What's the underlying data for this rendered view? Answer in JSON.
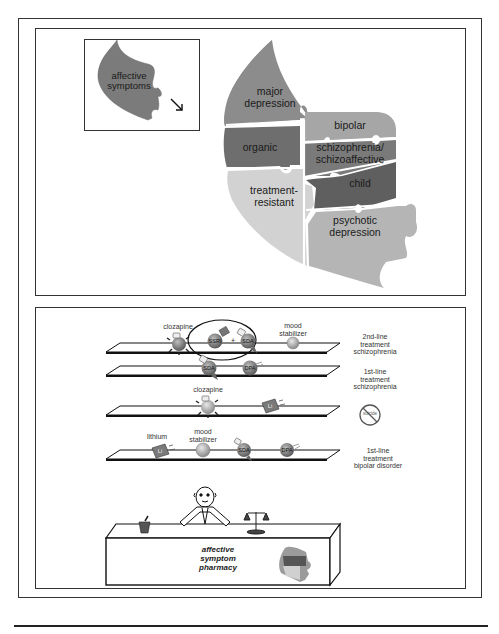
{
  "figure": {
    "top_panel": {
      "inset": {
        "piece_label_line1": "affective",
        "piece_label_line2": "symptoms",
        "arrow": "arrow-down-right"
      },
      "puzzle_pieces": [
        {
          "id": "major-depression",
          "line1": "major",
          "line2": "depression",
          "color": "#8c8c8c"
        },
        {
          "id": "bipolar",
          "line1": "bipolar",
          "line2": "",
          "color": "#a6a6a6"
        },
        {
          "id": "organic",
          "line1": "organic",
          "line2": "",
          "color": "#6e6e6e"
        },
        {
          "id": "schizophrenia-schizoaffective",
          "line1": "schizophrenia/",
          "line2": "schizoaffective",
          "color": "#7a7a7a"
        },
        {
          "id": "treatment-resistant",
          "line1": "treatment-",
          "line2": "resistant",
          "color": "#d2d2d2"
        },
        {
          "id": "child",
          "line1": "child",
          "line2": "",
          "color": "#5f5f5f"
        },
        {
          "id": "psychotic-depression",
          "line1": "psychotic",
          "line2": "depression",
          "color": "#b5b5b5"
        }
      ]
    },
    "bottom_panel": {
      "shelves": [
        {
          "label_lines": [
            "2nd-line",
            "treatment",
            "schizophrenia"
          ],
          "items": [
            {
              "type": "clozapine",
              "caption": "clozapine"
            },
            {
              "type": "SSRI",
              "caption": "SSRI"
            },
            {
              "type": "plus",
              "caption": "+"
            },
            {
              "type": "SDA",
              "caption": "SDA"
            },
            {
              "type": "mood-stabilizer",
              "caption_line1": "mood",
              "caption_line2": "stabilizer"
            }
          ],
          "grouped": "SSRI + SDA"
        },
        {
          "label_lines": [
            "1st-line",
            "treatment",
            "schizophrenia"
          ],
          "items": [
            {
              "type": "SDA",
              "caption": "SDA"
            },
            {
              "type": "DPA",
              "caption": "DPA"
            }
          ]
        },
        {
          "label_lines": [],
          "side_icon": {
            "type": "no-suicide",
            "text": "suicide"
          },
          "items": [
            {
              "type": "clozapine",
              "caption": "clozapine"
            },
            {
              "type": "lithium",
              "caption": "Li"
            }
          ]
        },
        {
          "label_lines": [
            "1st-line",
            "treatment",
            "bipolar disorder"
          ],
          "items": [
            {
              "type": "lithium",
              "caption": "lithium",
              "badge": "Li"
            },
            {
              "type": "mood-stabilizer",
              "caption_line1": "mood",
              "caption_line2": "stabilizer"
            },
            {
              "type": "SDA",
              "caption": "SDA"
            },
            {
              "type": "DPA",
              "caption": "DPA"
            }
          ]
        }
      ],
      "pharmacy": {
        "counter_line1": "affective",
        "counter_line2": "symptom",
        "counter_line3": "pharmacy"
      }
    }
  }
}
